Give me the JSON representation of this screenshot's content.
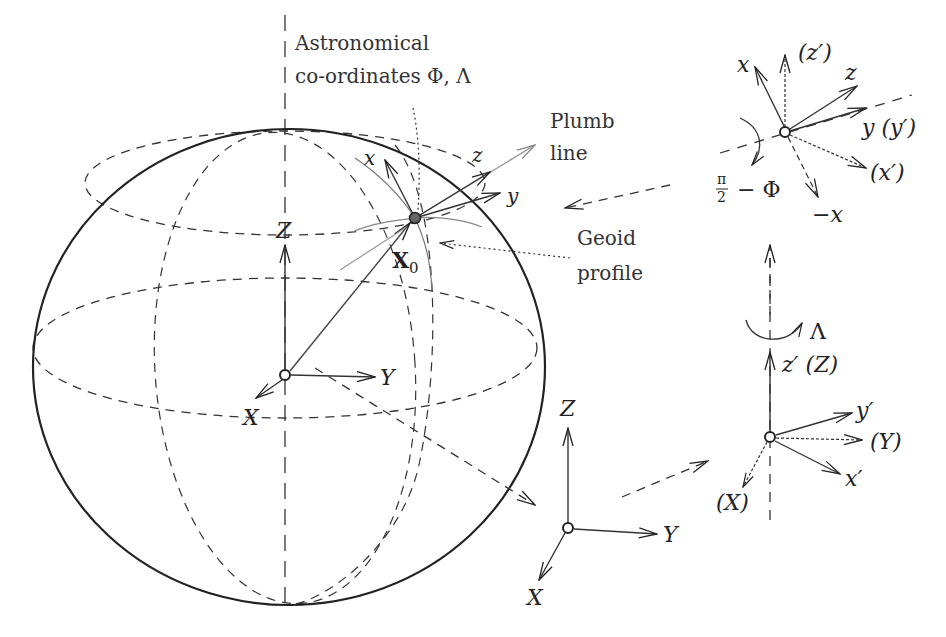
{
  "figure": {
    "annotations": {
      "astronomical_line1": "Astronomical",
      "astronomical_line2": "co-ordinates Φ, Λ",
      "plumb_line1": "Plumb",
      "plumb_line2": "line",
      "geoid_line1": "Geoid",
      "geoid_line2": "profile"
    },
    "global_frame": {
      "x_label": "X",
      "y_label": "Y",
      "z_label": "Z",
      "station_label": "X",
      "station_subscript": "0"
    },
    "local_frame": {
      "x_label": "x",
      "y_label": "y",
      "z_label": "z"
    },
    "bottom_frame": {
      "x_label": "X",
      "y_label": "Y",
      "z_label": "Z"
    },
    "rotation_lambda": {
      "angle_label": "Λ",
      "z_label": "z′ (Z)",
      "y_prime_label": "y′",
      "Y_label": "(Y)",
      "x_prime_label": "x′",
      "X_label": "(X)"
    },
    "rotation_phi": {
      "angle_label_num": "π",
      "angle_label_den": "2",
      "angle_label_rest": "− Φ",
      "x_label": "x",
      "z_prime_label": "(z′)",
      "z_label": "z",
      "y_label": "y (y′)",
      "x_prime_label": "(x′)",
      "neg_x_label": "−x"
    }
  },
  "colors": {
    "ink": "#222222",
    "gray_ink": "#8a8a8a",
    "station_fill": "#666666"
  }
}
